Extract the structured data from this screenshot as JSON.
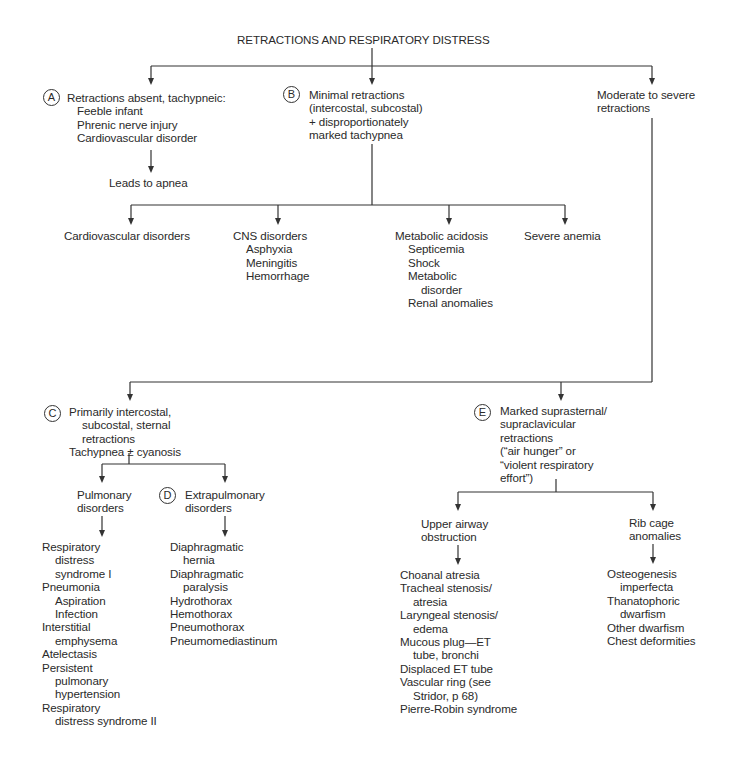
{
  "diagram": {
    "title": "RETRACTIONS AND RESPIRATORY DISTRESS",
    "badges": {
      "A": "A",
      "B": "B",
      "C": "C",
      "D": "D",
      "E": "E"
    },
    "nodeA": {
      "heading": "Retractions absent, tachypneic:",
      "items": [
        "Feeble infant",
        "Phrenic nerve injury",
        "Cardiovascular disorder"
      ],
      "outcome": "Leads to apnea"
    },
    "nodeB": {
      "lines": [
        "Minimal retractions",
        "(intercostal, subcostal)",
        "+ disproportionately",
        "marked tachypnea"
      ],
      "children": {
        "cardio": "Cardiovascular disorders",
        "cns": {
          "heading": "CNS disorders",
          "items": [
            "Asphyxia",
            "Meningitis",
            "Hemorrhage"
          ]
        },
        "metabolic": {
          "heading": "Metabolic acidosis",
          "items": [
            "Septicemia",
            "Shock",
            "Metabolic",
            "disorder",
            "Renal anomalies"
          ]
        },
        "anemia": "Severe anemia"
      }
    },
    "nodeModerate": {
      "lines": [
        "Moderate to severe",
        "retractions"
      ]
    },
    "nodeC": {
      "lines": [
        "Primarily intercostal,",
        "subcostal, sternal",
        "retractions",
        "Tachypnea ± cyanosis"
      ],
      "pulmonary": {
        "heading": [
          "Pulmonary",
          "disorders"
        ],
        "items": [
          "Respiratory",
          "distress",
          "syndrome I",
          "Pneumonia",
          "Aspiration",
          "Infection",
          "Interstitial",
          "emphysema",
          "Atelectasis",
          "Persistent",
          "pulmonary",
          "hypertension",
          "Respiratory",
          "distress syndrome II"
        ]
      },
      "extrapulmonary": {
        "heading": [
          "Extrapulmonary",
          "disorders"
        ],
        "items": [
          "Diaphragmatic",
          "hernia",
          "Diaphragmatic",
          "paralysis",
          "Hydrothorax",
          "Hemothorax",
          "Pneumothorax",
          "Pneumomediastinum"
        ]
      }
    },
    "nodeE": {
      "lines": [
        "Marked suprasternal/",
        "supraclavicular",
        "retractions",
        "(“air hunger” or",
        "“violent respiratory",
        "effort”)"
      ],
      "upperAirway": {
        "heading": [
          "Upper airway",
          "obstruction"
        ],
        "items": [
          "Choanal atresia",
          "Tracheal stenosis/",
          "atresia",
          "Laryngeal stenosis/",
          "edema",
          "Mucous plug—ET",
          "tube, bronchi",
          "Displaced ET tube",
          "Vascular ring (see",
          "Stridor, p 68)",
          "Pierre-Robin syndrome"
        ]
      },
      "ribCage": {
        "heading": [
          "Rib cage",
          "anomalies"
        ],
        "items": [
          "Osteogenesis",
          "imperfecta",
          "Thanatophoric",
          "dwarfism",
          "Other dwarfism",
          "Chest deformities"
        ]
      }
    },
    "colors": {
      "line": "#333333",
      "text": "#2a2a2a",
      "background": "#ffffff"
    }
  }
}
